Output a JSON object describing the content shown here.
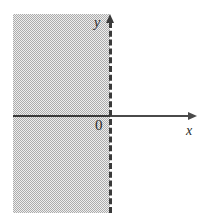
{
  "figure": {
    "kind": "coordinate-plane-inequality-graph",
    "width": 203,
    "height": 213,
    "background_color": "#ffffff"
  },
  "chart_data": {
    "type": "area",
    "title": "",
    "subtitle": "",
    "xlabel": "x",
    "ylabel": "y",
    "grid": false,
    "legend_position": "none",
    "axis_color": "#3a3a3a",
    "shade_color": "#9a9a9a",
    "origin_label": "0",
    "xlim": [
      -3.2,
      2.9
    ],
    "ylim": [
      -3.1,
      3.2
    ],
    "tick_labels": {
      "x": [],
      "y": []
    },
    "annotations": [],
    "regions": [
      {
        "name": "solution-region",
        "description": "half-plane strictly left of the vertical line x = 0",
        "inequality": "x < 0",
        "fill": "#9a9a9a",
        "fill_style": "halftone-dither",
        "boundary": {
          "name": "vertical-boundary-line",
          "equation": "x = 0",
          "style": "dashed",
          "included": false,
          "color": "#3a3a3a"
        }
      }
    ],
    "axes": [
      {
        "name": "x-axis",
        "orientation": "horizontal",
        "label": "x",
        "arrow_end": "positive",
        "style": "solid"
      },
      {
        "name": "y-axis",
        "orientation": "vertical",
        "label": "y",
        "arrow_end": "positive",
        "style": "dashed"
      }
    ]
  },
  "labels": {
    "y_axis": "y",
    "x_axis": "x",
    "origin": "0"
  }
}
